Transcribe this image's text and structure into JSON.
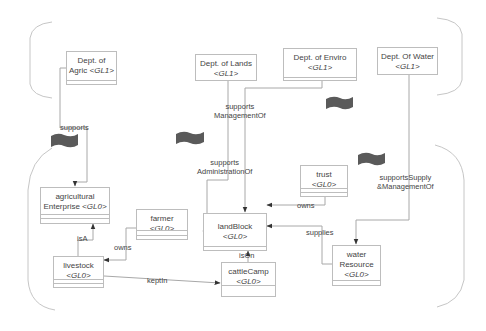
{
  "diagram": {
    "type": "class-diagram",
    "levels": [
      "GL1",
      "GL0"
    ],
    "colors": {
      "line": "#a8a8a8",
      "box_border": "#bdbdbd",
      "text": "#444444",
      "flag": "#555555"
    },
    "nodes": {
      "dept_agric": {
        "title": "Dept. of",
        "title2": "Agric",
        "tag": "<GL1>"
      },
      "dept_lands": {
        "title": "Dept. of Lands",
        "tag": "<GL1>"
      },
      "dept_enviro": {
        "title": "Dept. of Enviro",
        "tag": "<GL1>"
      },
      "dept_water": {
        "title": "Dept. Of Water",
        "tag": "<GL1>"
      },
      "agri_enterprise": {
        "title": "agricultural",
        "title2": "Enterprise",
        "tag": "<GL0>"
      },
      "farmer": {
        "title": "farmer",
        "tag": "<GL0>"
      },
      "land_block": {
        "title": "landBlock",
        "tag": "<GL0>"
      },
      "trust": {
        "title": "trust",
        "tag": "<GL0>"
      },
      "livestock": {
        "title": "livestock",
        "tag": "<GL0>"
      },
      "cattle_camp": {
        "title": "cattleCamp",
        "tag": "<GL0>"
      },
      "water_resource": {
        "title": "water",
        "title2": "Resource",
        "tag": "<GL0>"
      }
    },
    "edges": {
      "supports": "supports",
      "supports_mgmt_1": "supports",
      "supports_mgmt_2": "ManagementOf",
      "supports_admin_1": "supports",
      "supports_admin_2": "AdministrationOf",
      "supports_supply_1": "supportsSupply",
      "supports_supply_2": "&ManagementOf",
      "owns_trust": "owns",
      "supplies": "supplies",
      "is_a": "isA",
      "owns_farmer": "owns",
      "is_on": "isOn",
      "kept_in": "keptIn"
    }
  }
}
